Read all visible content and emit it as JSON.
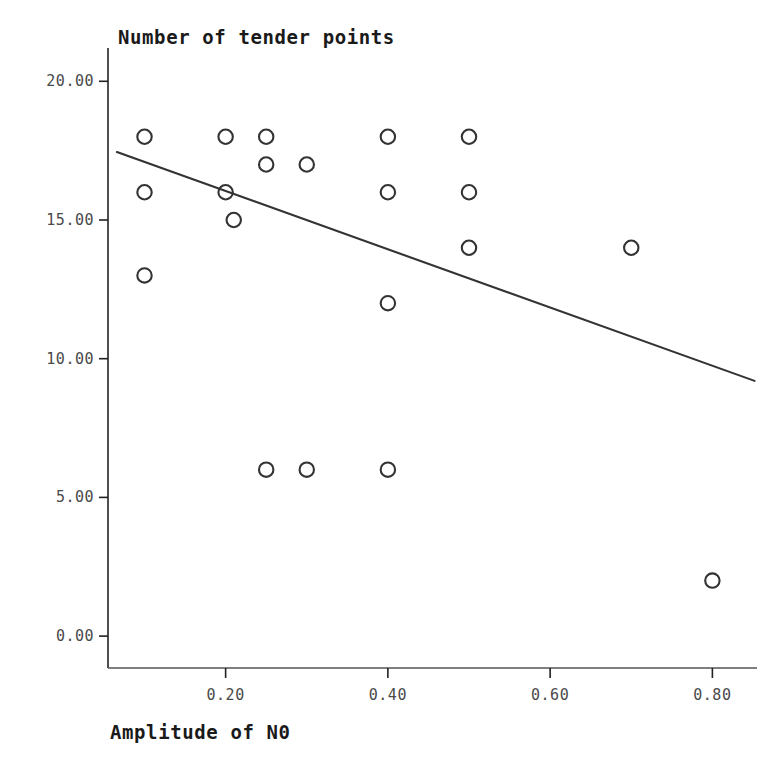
{
  "chart_data": {
    "type": "scatter",
    "title": "Number of tender points",
    "xlabel": "Amplitude of N0",
    "ylabel": "",
    "xlim": [
      0.055,
      0.855
    ],
    "ylim": [
      -1.15,
      21.2
    ],
    "xticks": [
      0.2,
      0.4,
      0.6,
      0.8
    ],
    "xtick_labels": [
      "0.20",
      "0.40",
      "0.60",
      "0.80"
    ],
    "yticks": [
      0.0,
      5.0,
      10.0,
      15.0,
      20.0
    ],
    "ytick_labels": [
      "0.00",
      "5.00",
      "10.00",
      "15.00",
      "20.00"
    ],
    "grid": false,
    "legend": null,
    "marker": "open-circle",
    "marker_color": "#333333",
    "line_color": "#333333",
    "points": [
      {
        "x": 0.1,
        "y": 18
      },
      {
        "x": 0.1,
        "y": 16
      },
      {
        "x": 0.1,
        "y": 13
      },
      {
        "x": 0.2,
        "y": 18
      },
      {
        "x": 0.2,
        "y": 16
      },
      {
        "x": 0.21,
        "y": 15
      },
      {
        "x": 0.25,
        "y": 18
      },
      {
        "x": 0.25,
        "y": 17
      },
      {
        "x": 0.3,
        "y": 17
      },
      {
        "x": 0.4,
        "y": 18
      },
      {
        "x": 0.4,
        "y": 16
      },
      {
        "x": 0.4,
        "y": 12
      },
      {
        "x": 0.5,
        "y": 18
      },
      {
        "x": 0.5,
        "y": 16
      },
      {
        "x": 0.5,
        "y": 14
      },
      {
        "x": 0.7,
        "y": 14
      },
      {
        "x": 0.25,
        "y": 6
      },
      {
        "x": 0.3,
        "y": 6
      },
      {
        "x": 0.4,
        "y": 6
      },
      {
        "x": 0.8,
        "y": 2
      }
    ],
    "fit_line": {
      "name": "linear-fit",
      "x_start": 0.066,
      "y_start": 17.45,
      "x_end": 0.852,
      "y_end": 9.2
    }
  }
}
